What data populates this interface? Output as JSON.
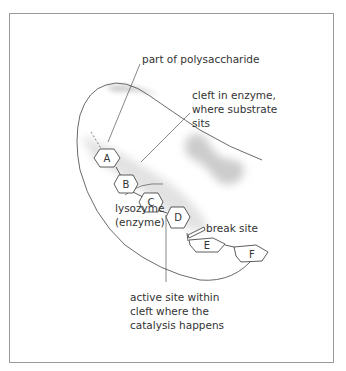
{
  "diagram": {
    "colors": {
      "outline": "#333333",
      "shading": "#d8d8d8",
      "frame": "#9a9a9a",
      "text": "#333333"
    },
    "labels": {
      "polysaccharide": "part of polysaccharide",
      "cleft_line1": "cleft in enzyme,",
      "cleft_line2": "where substrate",
      "cleft_line3": "sits",
      "break_site": "break site",
      "lysozyme_line1": "lysozyme",
      "lysozyme_line2": "(enzyme)",
      "active_line1": "active site within",
      "active_line2": "cleft where the",
      "active_line3": "catalysis happens"
    },
    "sugar_units": [
      {
        "id": "A",
        "label": "A"
      },
      {
        "id": "B",
        "label": "B"
      },
      {
        "id": "C",
        "label": "C"
      },
      {
        "id": "D",
        "label": "D"
      },
      {
        "id": "E",
        "label": "E"
      },
      {
        "id": "F",
        "label": "F"
      }
    ]
  }
}
